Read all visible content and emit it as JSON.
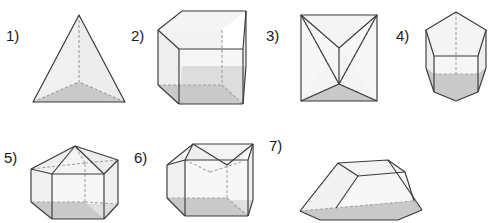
{
  "page": {
    "kind": "geometry-solids-worksheet",
    "background": "#ffffff",
    "width": 492,
    "height": 223
  },
  "style": {
    "edge_color": "#3a3a3a",
    "hidden_edge_color": "#9a9a9a",
    "face_light": "#f2f2f2",
    "face_shaded": "#c9c9c9",
    "face_mid": "#e6e6e6",
    "label_color": "#1a1a1a",
    "stroke_width": 1.1,
    "hidden_dash": "3,2"
  },
  "figures": [
    {
      "id": "fig1",
      "label": "1)",
      "name": "triangular-pyramid",
      "description": "triangular pyramid (tetrahedron) with shaded triangular base",
      "label_pos": {
        "x": 6,
        "y": 28
      },
      "box": {
        "x": 28,
        "y": 10,
        "w": 100,
        "h": 96
      }
    },
    {
      "id": "fig2",
      "label": "2)",
      "name": "cube",
      "description": "cube with dashed hidden edges and shaded bottom face",
      "label_pos": {
        "x": 131,
        "y": 28
      },
      "box": {
        "x": 155,
        "y": 8,
        "w": 92,
        "h": 98
      }
    },
    {
      "id": "fig3",
      "label": "3)",
      "name": "box-with-inverted-pyramid",
      "description": "rectangular box containing an inverted pyramid forming a bowtie pattern",
      "label_pos": {
        "x": 266,
        "y": 28
      },
      "box": {
        "x": 296,
        "y": 10,
        "w": 84,
        "h": 94
      }
    },
    {
      "id": "fig4",
      "label": "4)",
      "name": "pentagonal-prism",
      "description": "pentagonal prism with shaded pentagonal base",
      "label_pos": {
        "x": 396,
        "y": 28
      },
      "box": {
        "x": 420,
        "y": 8,
        "w": 70,
        "h": 98
      }
    },
    {
      "id": "fig5",
      "label": "5)",
      "name": "box-with-hip-roof",
      "description": "rectangular prism topped by a pyramidal hip roof",
      "label_pos": {
        "x": 4,
        "y": 150
      },
      "box": {
        "x": 28,
        "y": 130,
        "w": 96,
        "h": 93
      }
    },
    {
      "id": "fig6",
      "label": "6)",
      "name": "box-with-indented-top",
      "description": "rectangular box with a depressed or indented top face",
      "label_pos": {
        "x": 134,
        "y": 150
      },
      "box": {
        "x": 163,
        "y": 130,
        "w": 92,
        "h": 93
      }
    },
    {
      "id": "fig7",
      "label": "7)",
      "name": "truncated-pyramid-frustum",
      "description": "truncated pyramid (frustum) with shaded trapezoidal base",
      "label_pos": {
        "x": 269,
        "y": 138
      },
      "box": {
        "x": 290,
        "y": 150,
        "w": 135,
        "h": 73
      }
    }
  ]
}
